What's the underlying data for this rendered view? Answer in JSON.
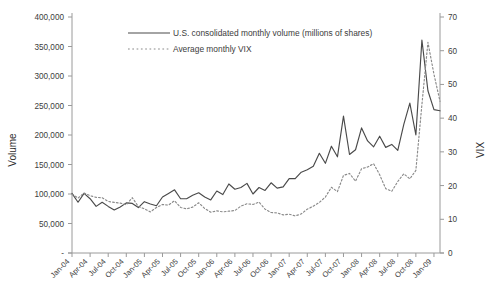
{
  "chart_data": {
    "type": "line",
    "title": "",
    "xlabel": "",
    "ylabel": "Volume",
    "y2label": "VIX",
    "ylim": [
      0,
      400000
    ],
    "y2lim": [
      0,
      70
    ],
    "grid": false,
    "legend_position": "top-center",
    "y_ticks": [
      "-",
      "50,000",
      "100,000",
      "150,000",
      "200,000",
      "250,000",
      "300,000",
      "350,000",
      "400,000"
    ],
    "y_tick_values": [
      0,
      50000,
      100000,
      150000,
      200000,
      250000,
      300000,
      350000,
      400000
    ],
    "y2_ticks": [
      "0",
      "10",
      "20",
      "30",
      "40",
      "50",
      "60",
      "70"
    ],
    "y2_tick_values": [
      0,
      10,
      20,
      30,
      40,
      50,
      60,
      70
    ],
    "x_tick_labels": [
      "Jan-04",
      "Apr-04",
      "Jul-04",
      "Oct-04",
      "Jan-05",
      "Apr-05",
      "Jul-05",
      "Oct-05",
      "Jan-06",
      "Apr-06",
      "Jul-06",
      "Oct-06",
      "Jan-07",
      "Apr-07",
      "Jul-07",
      "Oct-07",
      "Jan-08",
      "Apr-08",
      "Jul-08",
      "Oct-08",
      "Jan-09"
    ],
    "x_tick_interval_months": 3,
    "x_start": "Jan-04",
    "x_end": "Jan-09",
    "series": [
      {
        "name": "U.S. consolidated monthly volume (millions of shares)",
        "style": "solid",
        "color": "#4a4a4a",
        "axis": "left",
        "values": [
          101000,
          86000,
          101000,
          92000,
          79000,
          86000,
          79000,
          73000,
          78000,
          85000,
          84000,
          77000,
          87000,
          83000,
          80000,
          95000,
          101000,
          107000,
          92000,
          92000,
          98000,
          102000,
          95000,
          90000,
          105000,
          99000,
          117000,
          108000,
          111000,
          118000,
          100000,
          111000,
          106000,
          119000,
          110000,
          112000,
          126000,
          126000,
          137000,
          141000,
          147000,
          169000,
          152000,
          181000,
          163000,
          232000,
          167000,
          175000,
          212000,
          190000,
          180000,
          198000,
          179000,
          184000,
          174000,
          218000,
          254000,
          200000,
          361000,
          275000,
          243000,
          241000
        ]
      },
      {
        "name": "Average monthly VIX",
        "style": "dotted",
        "color": "#8a8a8a",
        "axis": "right",
        "values": [
          17.5,
          16.3,
          17.8,
          17.0,
          16.5,
          16.4,
          15.3,
          15.0,
          14.8,
          14.3,
          16.4,
          13.8,
          13.1,
          12.2,
          13.5,
          14.4,
          14.2,
          15.5,
          13.5,
          13.1,
          13.6,
          14.9,
          13.2,
          12.1,
          12.5,
          12.2,
          12.4,
          12.6,
          13.9,
          14.6,
          14.4,
          15.1,
          13.0,
          12.0,
          11.9,
          11.3,
          11.5,
          11.0,
          11.6,
          13.0,
          13.9,
          15.0,
          16.6,
          19.5,
          18.2,
          23.0,
          23.6,
          21.3,
          25.0,
          25.5,
          26.5,
          23.2,
          19.1,
          18.3,
          21.2,
          23.5,
          22.0,
          24.5,
          44.0,
          62.5,
          53.0,
          45.0
        ]
      }
    ],
    "annotations": []
  },
  "legend": {
    "items": [
      {
        "label": "U.S. consolidated monthly volume (millions of shares)",
        "style": "solid"
      },
      {
        "label": "Average monthly VIX",
        "style": "dotted"
      }
    ]
  },
  "axes": {
    "left_title": "Volume",
    "right_title": "VIX"
  }
}
